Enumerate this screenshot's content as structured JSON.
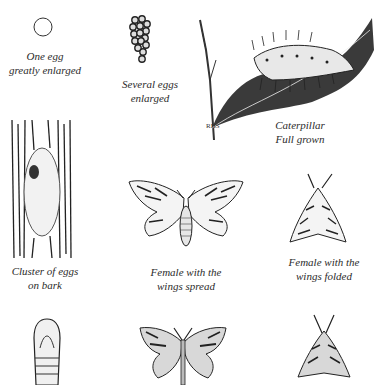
{
  "plate": {
    "subject": "Moth life cycle illustration",
    "panels": [
      {
        "id": "one-egg",
        "caption_line1": "One egg",
        "caption_line2": "greatly enlarged"
      },
      {
        "id": "several-eggs",
        "caption_line1": "Several eggs",
        "caption_line2": "enlarged"
      },
      {
        "id": "caterpillar",
        "caption_line1": "Caterpillar",
        "caption_line2": "Full grown"
      },
      {
        "id": "egg-cluster",
        "caption_line1": "Cluster of eggs",
        "caption_line2": "on bark"
      },
      {
        "id": "female-spread",
        "caption_line1": "Female with the",
        "caption_line2": "wings spread"
      },
      {
        "id": "female-folded",
        "caption_line1": "Female with the",
        "caption_line2": "wings folded"
      },
      {
        "id": "pupa",
        "caption_line1": "",
        "caption_line2": ""
      },
      {
        "id": "male-spread",
        "caption_line1": "",
        "caption_line2": ""
      },
      {
        "id": "male-folded",
        "caption_line1": "",
        "caption_line2": ""
      }
    ],
    "artist_signature": "RHS"
  },
  "colors": {
    "ink": "#2a2a2a",
    "paper": "#ffffff"
  }
}
